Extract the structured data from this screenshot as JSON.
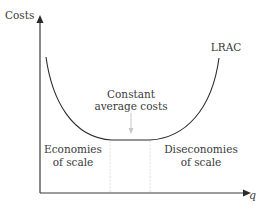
{
  "diagram": {
    "axes": {
      "y_label": "Costs",
      "x_label": "q"
    },
    "curve": {
      "label": "LRAC",
      "color": "#2b2b2b"
    },
    "annotations": {
      "constant_line1": "Constant",
      "constant_line2": "average costs",
      "economies_line1": "Economies",
      "economies_line2": "of scale",
      "diseconomies_line1": "Diseconomies",
      "diseconomies_line2": "of scale"
    },
    "colors": {
      "axis": "#3a3a3a",
      "text": "#3a3a3a",
      "guide": "#d8d8d8",
      "pointer_arrow": "#c8c8c8"
    }
  }
}
